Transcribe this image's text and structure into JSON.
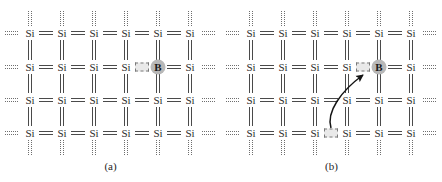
{
  "figure": {
    "background_color": "#ffffff",
    "bond_color": "#4a4a4a",
    "dotted_color": "#6e6e6e",
    "dopant_disc_color": "#b8b8b8",
    "hole_fill_color": "#e9e9e9",
    "hole_border_color": "#7a7a7a",
    "atom_text_color": "#2b2b2b"
  },
  "panels": [
    {
      "id": "a",
      "caption": "(a)",
      "atoms": [
        {
          "label": "Si",
          "row": 0,
          "col": 0
        },
        {
          "label": "Si",
          "row": 0,
          "col": 1
        },
        {
          "label": "Si",
          "row": 0,
          "col": 2
        },
        {
          "label": "Si",
          "row": 0,
          "col": 3
        },
        {
          "label": "Si",
          "row": 0,
          "col": 4
        },
        {
          "label": "Si",
          "row": 0,
          "col": 5
        },
        {
          "label": "Si",
          "row": 1,
          "col": 0
        },
        {
          "label": "Si",
          "row": 1,
          "col": 1
        },
        {
          "label": "Si",
          "row": 1,
          "col": 2
        },
        {
          "label": "Si",
          "row": 1,
          "col": 3
        },
        {
          "label": "B",
          "row": 1,
          "col": 4,
          "dopant": true
        },
        {
          "label": "Si",
          "row": 1,
          "col": 5
        },
        {
          "label": "Si",
          "row": 2,
          "col": 0
        },
        {
          "label": "Si",
          "row": 2,
          "col": 1
        },
        {
          "label": "Si",
          "row": 2,
          "col": 2
        },
        {
          "label": "Si",
          "row": 2,
          "col": 3
        },
        {
          "label": "Si",
          "row": 2,
          "col": 4
        },
        {
          "label": "Si",
          "row": 2,
          "col": 5
        },
        {
          "label": "Si",
          "row": 3,
          "col": 0
        },
        {
          "label": "Si",
          "row": 3,
          "col": 1
        },
        {
          "label": "Si",
          "row": 3,
          "col": 2
        },
        {
          "label": "Si",
          "row": 3,
          "col": 3
        },
        {
          "label": "Si",
          "row": 3,
          "col": 4
        },
        {
          "label": "Si",
          "row": 3,
          "col": 5
        }
      ],
      "holes": [
        {
          "name": "hole-at-boron",
          "row": 1,
          "col": 3.5
        }
      ],
      "arrows": []
    },
    {
      "id": "b",
      "caption": "(b)",
      "atoms": [
        {
          "label": "Si",
          "row": 0,
          "col": 0
        },
        {
          "label": "Si",
          "row": 0,
          "col": 1
        },
        {
          "label": "Si",
          "row": 0,
          "col": 2
        },
        {
          "label": "Si",
          "row": 0,
          "col": 3
        },
        {
          "label": "Si",
          "row": 0,
          "col": 4
        },
        {
          "label": "Si",
          "row": 0,
          "col": 5
        },
        {
          "label": "Si",
          "row": 1,
          "col": 0
        },
        {
          "label": "Si",
          "row": 1,
          "col": 1
        },
        {
          "label": "Si",
          "row": 1,
          "col": 2
        },
        {
          "label": "Si",
          "row": 1,
          "col": 3
        },
        {
          "label": "B",
          "row": 1,
          "col": 4,
          "dopant": true
        },
        {
          "label": "Si",
          "row": 1,
          "col": 5
        },
        {
          "label": "Si",
          "row": 2,
          "col": 0
        },
        {
          "label": "Si",
          "row": 2,
          "col": 1
        },
        {
          "label": "Si",
          "row": 2,
          "col": 2
        },
        {
          "label": "Si",
          "row": 2,
          "col": 3
        },
        {
          "label": "Si",
          "row": 2,
          "col": 4
        },
        {
          "label": "Si",
          "row": 2,
          "col": 5
        },
        {
          "label": "Si",
          "row": 3,
          "col": 0
        },
        {
          "label": "Si",
          "row": 3,
          "col": 1
        },
        {
          "label": "Si",
          "row": 3,
          "col": 2
        },
        {
          "label": "Si",
          "row": 3,
          "col": 3
        },
        {
          "label": "Si",
          "row": 3,
          "col": 4
        },
        {
          "label": "Si",
          "row": 3,
          "col": 5
        }
      ],
      "holes": [
        {
          "name": "hole-at-boron",
          "row": 1,
          "col": 3.5
        },
        {
          "name": "hole-source-lower-left",
          "row": 3,
          "col": 2.5
        }
      ],
      "arrows": [
        {
          "name": "hole-motion-arrow",
          "from_row": 3,
          "from_col": 2.5,
          "to_row": 1,
          "to_col": 3.45
        }
      ]
    }
  ],
  "geometry": {
    "col_x": [
      30,
      62,
      94,
      126,
      158,
      190
    ],
    "row_y": [
      33,
      67,
      100,
      133
    ],
    "atom_half_width": 9,
    "atom_half_height": 7,
    "stub_length": 15,
    "edge_marker_width": 13
  }
}
